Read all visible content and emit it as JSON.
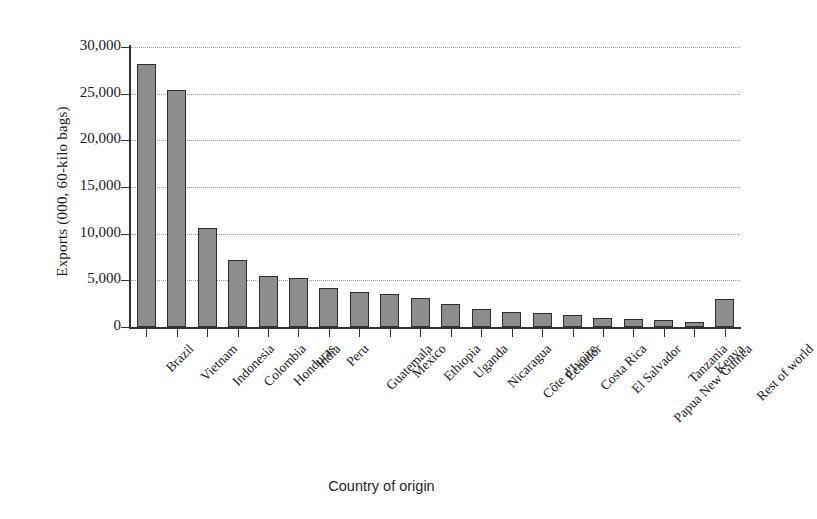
{
  "chart_data": {
    "type": "bar",
    "title": "",
    "xlabel": "Country of origin",
    "ylabel": "Exports (000, 60-kilo bags)",
    "ylim": [
      0,
      30000
    ],
    "ytick_labels": [
      "0",
      "5,000",
      "10,000",
      "15,000",
      "20,000",
      "25,000",
      "30,000"
    ],
    "ytick_values": [
      0,
      5000,
      10000,
      15000,
      20000,
      25000,
      30000
    ],
    "grid": "horizontal-dotted",
    "legend": "none",
    "bar_color": "#8d8d8d",
    "bar_edge_color": "#2e2e2e",
    "categories": [
      "Brazil",
      "Vietnam",
      "Indonesia",
      "Colombia",
      "Honduras",
      "India",
      "Peru",
      "Guatemala",
      "Mexico",
      "Ethiopia",
      "Uganda",
      "Nicaragua",
      "Côte d'Ivoire",
      "Ecuador",
      "Costa Rica",
      "El Salvador",
      "Papua New Guinea",
      "Tanzania",
      "Kenya",
      "Rest of world"
    ],
    "values": [
      28200,
      25400,
      10600,
      7150,
      5500,
      5300,
      4200,
      3700,
      3500,
      3100,
      2500,
      1900,
      1600,
      1450,
      1250,
      950,
      850,
      700,
      550,
      3000
    ]
  }
}
